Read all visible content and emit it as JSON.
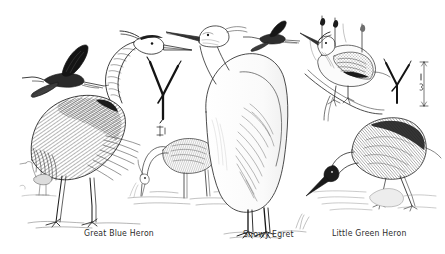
{
  "plate": {
    "kind": "field-guide-illustration-plate",
    "medium": "pen-and-ink line drawing",
    "background_color": "#ffffff",
    "ink_color": "#1d1d1d",
    "width": 445,
    "height": 254
  },
  "captions": [
    {
      "label": "Great Blue Heron"
    },
    {
      "label": "Snowy Egret"
    },
    {
      "label": "Little Green Heron"
    }
  ],
  "figures": [
    {
      "name": "great-blue-heron-standing",
      "species": "Great Blue Heron"
    },
    {
      "name": "great-blue-heron-in-flight",
      "species": "Great Blue Heron"
    },
    {
      "name": "great-blue-heron-track",
      "species": "Great Blue Heron"
    },
    {
      "name": "distant-heron-background",
      "species": "Great Blue Heron"
    },
    {
      "name": "snowy-egret-standing",
      "species": "Snowy Egret"
    },
    {
      "name": "snowy-egret-in-flight",
      "species": "Snowy Egret"
    },
    {
      "name": "heron-feeding-wading",
      "species": "Great Blue Heron"
    },
    {
      "name": "little-green-heron-perched",
      "species": "Little Green Heron"
    },
    {
      "name": "little-green-heron-striking",
      "species": "Little Green Heron"
    },
    {
      "name": "little-green-heron-track",
      "species": "Little Green Heron"
    },
    {
      "name": "track-scale-bar",
      "species": "Little Green Heron"
    }
  ]
}
